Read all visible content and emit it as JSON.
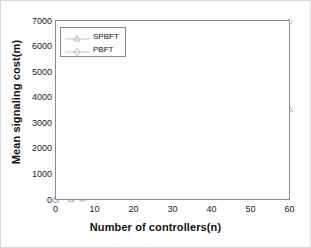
{
  "chart_data": {
    "type": "line",
    "title": "",
    "xlabel": "Number of controllers(n)",
    "ylabel": "Mean signaling cost(m)",
    "xlim": [
      0,
      60
    ],
    "ylim": [
      0,
      7000
    ],
    "xticks": [
      0,
      10,
      20,
      30,
      40,
      50,
      60
    ],
    "yticks": [
      0,
      1000,
      2000,
      3000,
      4000,
      5000,
      6000,
      7000
    ],
    "grid": true,
    "legend_position": "upper left",
    "x": [
      0,
      4,
      7,
      10,
      20,
      30,
      40,
      50,
      60
    ],
    "series": [
      {
        "name": "SPBFT",
        "marker": "triangle",
        "color": "#b9c6d6",
        "values": [
          0,
          20,
          55,
          110,
          390,
          890,
          1570,
          2470,
          3540
        ]
      },
      {
        "name": "PBFT",
        "marker": "diamond",
        "color": "#b9c6d6",
        "values": [
          0,
          30,
          80,
          150,
          720,
          1690,
          3060,
          5800,
          6950
        ]
      }
    ]
  },
  "axes": {
    "xtick_labels": [
      "0",
      "10",
      "20",
      "30",
      "40",
      "50",
      "60"
    ],
    "ytick_labels": [
      "0",
      "1000",
      "2000",
      "3000",
      "4000",
      "5000",
      "6000",
      "7000"
    ]
  },
  "legend": {
    "entries": [
      {
        "label": "SPBFT"
      },
      {
        "label": "PBFT"
      }
    ]
  },
  "colors": {
    "line": "#b9c6d6",
    "axis": "#8a8a8a",
    "grid": "#eef1f5",
    "text": "#111111"
  }
}
